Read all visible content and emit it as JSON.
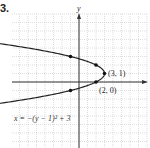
{
  "problem": {
    "number": "3."
  },
  "chart_data": {
    "type": "line",
    "title": "",
    "xlabel": "",
    "ylabel": "y",
    "equation": "x = −(y − 1)² + 3",
    "curve": "parabola opening left",
    "vertex": [
      3,
      1
    ],
    "points": [
      {
        "x": 3,
        "y": 1,
        "label": "(3, 1)"
      },
      {
        "x": 2,
        "y": 0,
        "label": "(2, 0)"
      },
      {
        "x": 2,
        "y": 2,
        "label": ""
      },
      {
        "x": -1,
        "y": 3,
        "label": ""
      },
      {
        "x": -1,
        "y": -1,
        "label": ""
      }
    ],
    "xlim": [
      -8,
      8
    ],
    "ylim": [
      -8,
      8
    ],
    "grid": true
  },
  "labels": {
    "y_axis": "y",
    "vertex": "(3, 1)",
    "x_intercept": "(2, 0)",
    "equation": "x = −(y − 1)² + 3"
  }
}
